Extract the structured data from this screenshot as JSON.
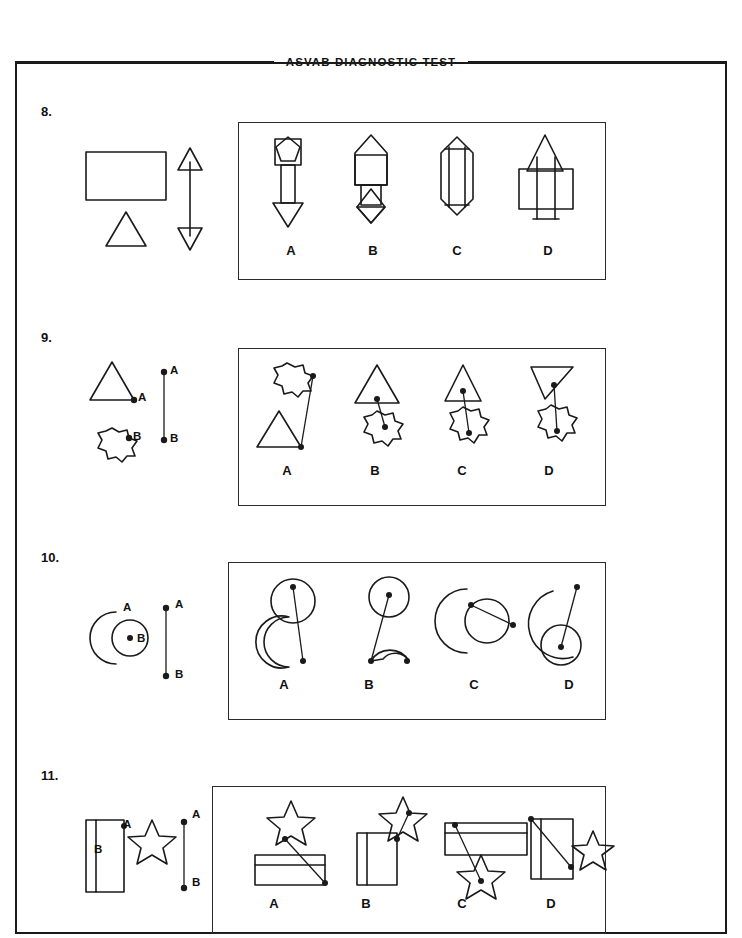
{
  "header": {
    "title": "ASVAB DIAGNOSTIC TEST"
  },
  "choice_letters": [
    "A",
    "B",
    "C",
    "D"
  ],
  "point_labels": {
    "a": "A",
    "b": "B"
  },
  "questions": [
    {
      "number": "8.",
      "prompt_description": "Rectangle, triangle and a double-headed vertical arrow",
      "choices": [
        "A",
        "B",
        "C",
        "D"
      ]
    },
    {
      "number": "9.",
      "prompt_description": "Triangle with point A and a 10-point star with point B, joined by a line segment A-B",
      "choices": [
        "A",
        "B",
        "C",
        "D"
      ]
    },
    {
      "number": "10.",
      "prompt_description": "Crescent with point A and a circle with point B, joined by a line segment A-B",
      "choices": [
        "A",
        "B",
        "C",
        "D"
      ]
    },
    {
      "number": "11.",
      "prompt_description": "Rectangle with point B and a five-pointed star with point A, joined by a line segment A-B",
      "choices": [
        "A",
        "B",
        "C",
        "D"
      ]
    }
  ]
}
